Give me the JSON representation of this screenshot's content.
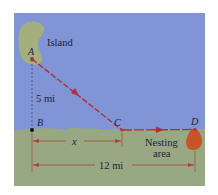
{
  "figure": {
    "colors": {
      "water": "#8094d6",
      "land": "#98a883",
      "island": "#a3b07e",
      "path": "#b0303a",
      "dimension": "#a8463a",
      "nesting": "#c8552a",
      "text": "#1d2340"
    },
    "labels": {
      "island": "Island",
      "point_a": "A",
      "point_b": "B",
      "point_c": "C",
      "point_d": "D",
      "ab_distance": "5 mi",
      "bc_distance": "x",
      "bd_distance": "12 mi",
      "nesting_line1": "Nesting",
      "nesting_line2": "area"
    }
  }
}
